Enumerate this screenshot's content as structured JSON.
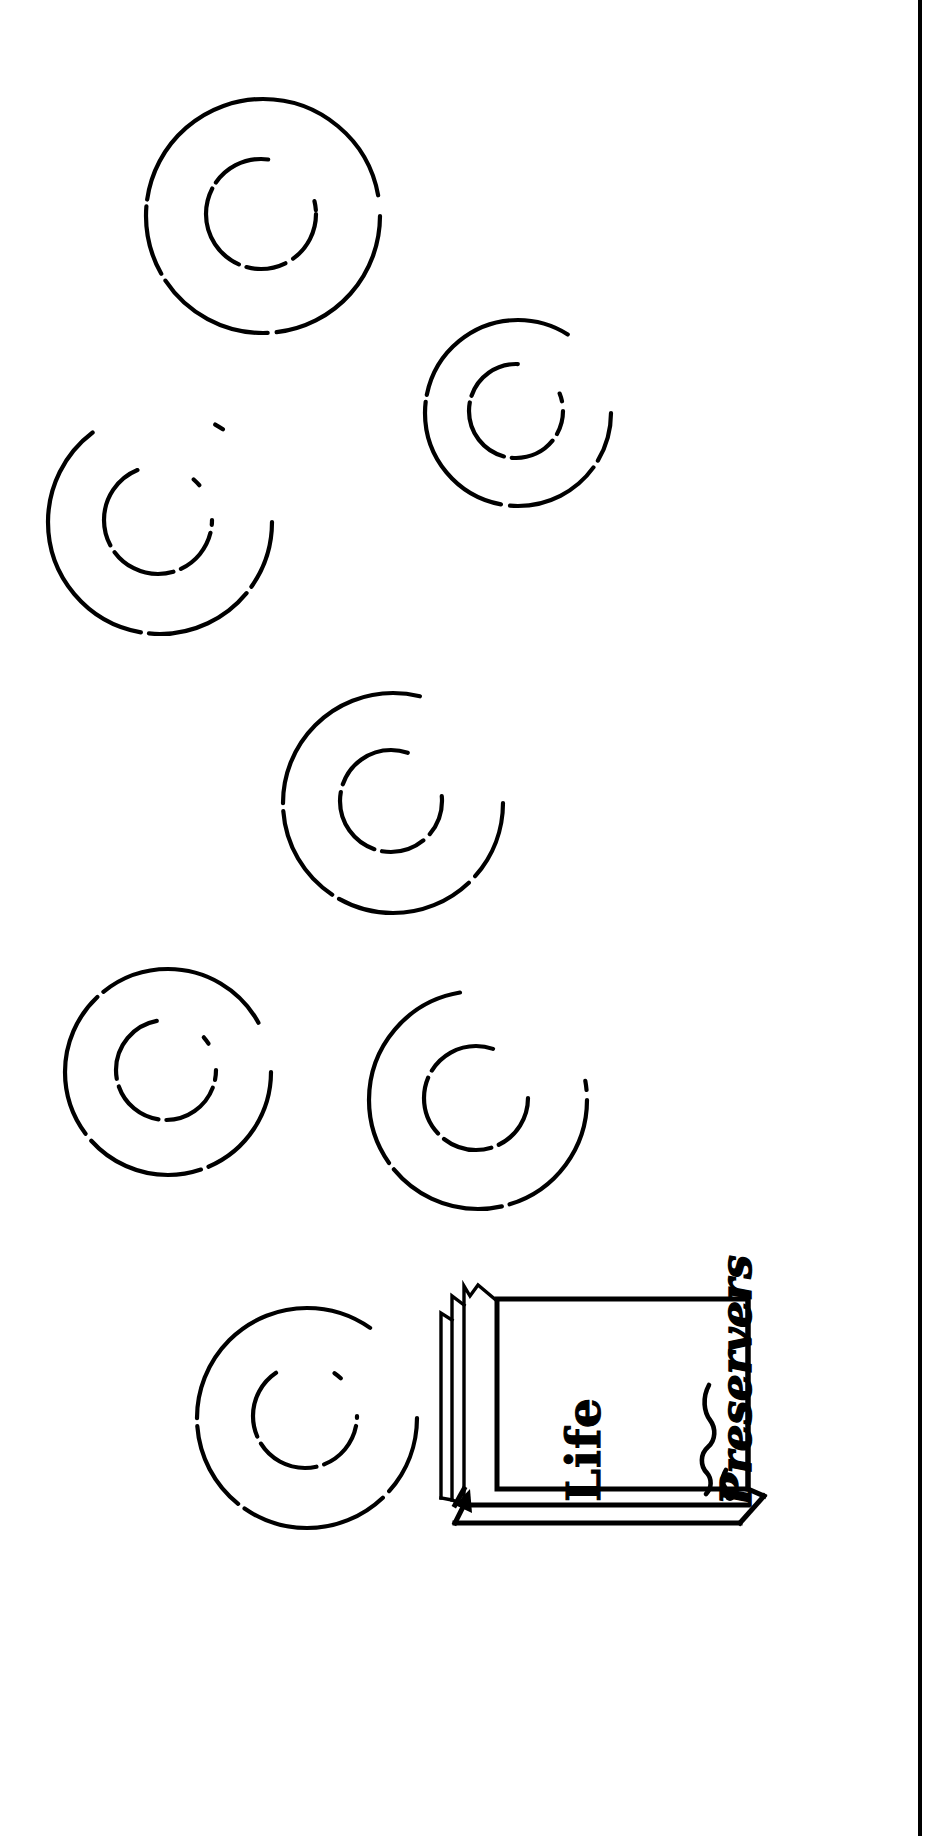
{
  "figure": {
    "kind": "line-art-illustration",
    "background_color": "#ffffff",
    "ink_color": "#000000"
  },
  "page_border": {
    "name": "right-rule",
    "visible": true,
    "x": 918,
    "width": 4,
    "color": "#000000"
  },
  "rings": [
    {
      "id": "ring-1",
      "cx": 263,
      "cy": 216,
      "r_outer": 117,
      "r_inner": 55,
      "label": "life-preserver-ring-1"
    },
    {
      "id": "ring-2",
      "cx": 518,
      "cy": 413,
      "r_outer": 93,
      "r_inner": 47,
      "label": "life-preserver-ring-2"
    },
    {
      "id": "ring-3",
      "cx": 160,
      "cy": 522,
      "r_outer": 112,
      "r_inner": 54,
      "label": "life-preserver-ring-3"
    },
    {
      "id": "ring-4",
      "cx": 393,
      "cy": 803,
      "r_outer": 110,
      "r_inner": 51,
      "label": "life-preserver-ring-4"
    },
    {
      "id": "ring-5",
      "cx": 168,
      "cy": 1072,
      "r_outer": 103,
      "r_inner": 50,
      "label": "life-preserver-ring-5"
    },
    {
      "id": "ring-6",
      "cx": 478,
      "cy": 1100,
      "r_outer": 109,
      "r_inner": 52,
      "label": "life-preserver-ring-6"
    },
    {
      "id": "ring-7",
      "cx": 307,
      "cy": 1418,
      "r_outer": 110,
      "r_inner": 52,
      "label": "life-preserver-ring-7"
    }
  ],
  "carton": {
    "name": "life-preserver-carton",
    "face": {
      "x": 497,
      "y": 1296,
      "w": 250,
      "h": 190
    },
    "labels": {
      "line1": "Life",
      "line2": "Preservers"
    },
    "decoration": "squiggle-flourish",
    "flaps": "open-top-flaps-left",
    "has_3d_base": true
  },
  "chart_data": {
    "type": "scatter",
    "xlabel": "",
    "ylabel": "",
    "categories": [
      "ring-1",
      "ring-2",
      "ring-3",
      "ring-4",
      "ring-5",
      "ring-6",
      "ring-7"
    ],
    "values": [
      117,
      93,
      112,
      110,
      103,
      109,
      110
    ],
    "x": [
      263,
      518,
      160,
      393,
      168,
      478,
      307
    ],
    "y": [
      216,
      413,
      522,
      803,
      1072,
      1100,
      1418
    ],
    "annotations": [
      "Life",
      "Preservers"
    ],
    "grid": false,
    "legend_position": "none"
  }
}
